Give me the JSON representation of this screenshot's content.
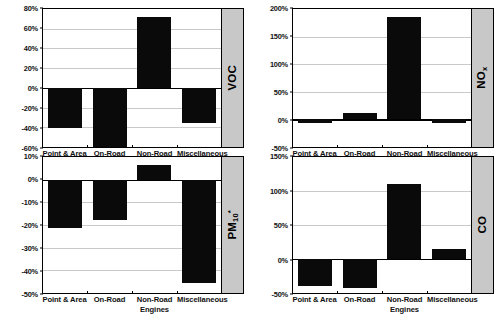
{
  "chart_data": [
    {
      "type": "bar",
      "title": "VOC",
      "pollutant_label": "VOC",
      "xlabel": "",
      "ylabel": "",
      "categories": [
        "Point & Area",
        "On-Road",
        "Non-Road Engines",
        "Miscellaneous"
      ],
      "values": [
        -41,
        -60,
        72,
        -36
      ],
      "ylim": [
        -60,
        80
      ],
      "yticks": [
        80,
        60,
        40,
        20,
        0,
        -20,
        -40,
        -60
      ],
      "ytick_labels": [
        "80%",
        "60%",
        "40%",
        "20%",
        "0%",
        "-20%",
        "-40%",
        "-60%"
      ],
      "grid": true,
      "legend": "none",
      "bar_color": "#0a0a0a"
    },
    {
      "type": "bar",
      "title": "NOx",
      "pollutant_label": "NO",
      "pollutant_sub": "x",
      "xlabel": "",
      "ylabel": "",
      "categories": [
        "Point & Area",
        "On-Road",
        "Non-Road Engines",
        "Miscellaneous"
      ],
      "values": [
        -6,
        12,
        185,
        -7
      ],
      "ylim": [
        -50,
        200
      ],
      "yticks": [
        200,
        150,
        100,
        50,
        0,
        -50
      ],
      "ytick_labels": [
        "200%",
        "150%",
        "100%",
        "50%",
        "0%",
        "-50%"
      ],
      "grid": true,
      "legend": "none",
      "bar_color": "#0a0a0a"
    },
    {
      "type": "bar",
      "title": "PM10*",
      "pollutant_label": "PM",
      "pollutant_sub": "10",
      "pollutant_sup": "*",
      "xlabel": "",
      "ylabel": "",
      "categories": [
        "Point & Area",
        "On-Road",
        "Non-Road Engines",
        "Miscellaneous"
      ],
      "values": [
        -21.5,
        -18,
        6.5,
        -45.5
      ],
      "ylim": [
        -50,
        10
      ],
      "yticks": [
        10,
        0,
        -10,
        -20,
        -30,
        -40,
        -50
      ],
      "ytick_labels": [
        "10%",
        "0%",
        "-10%",
        "-20%",
        "-30%",
        "-40%",
        "-50%"
      ],
      "grid": true,
      "legend": "none",
      "bar_color": "#0a0a0a"
    },
    {
      "type": "bar",
      "title": "CO",
      "pollutant_label": "CO",
      "xlabel": "",
      "ylabel": "",
      "categories": [
        "Point & Area",
        "On-Road",
        "Non-Road Engines",
        "Miscellaneous"
      ],
      "values": [
        -39,
        -42,
        110,
        15
      ],
      "ylim": [
        -50,
        150
      ],
      "yticks": [
        150,
        100,
        50,
        0,
        -50
      ],
      "ytick_labels": [
        "150%",
        "100%",
        "50%",
        "0%",
        "-50%"
      ],
      "grid": true,
      "legend": "none",
      "bar_color": "#0a0a0a"
    }
  ],
  "panels": {
    "voc": {
      "index": 0
    },
    "nox": {
      "index": 1
    },
    "pm10": {
      "index": 2
    },
    "co": {
      "index": 3
    }
  },
  "colors": {
    "bar": "#0a0a0a",
    "grid": "#c9c9c9",
    "axis": "#000000",
    "side_strip": "#c8c8c8",
    "background": "#ffffff"
  }
}
